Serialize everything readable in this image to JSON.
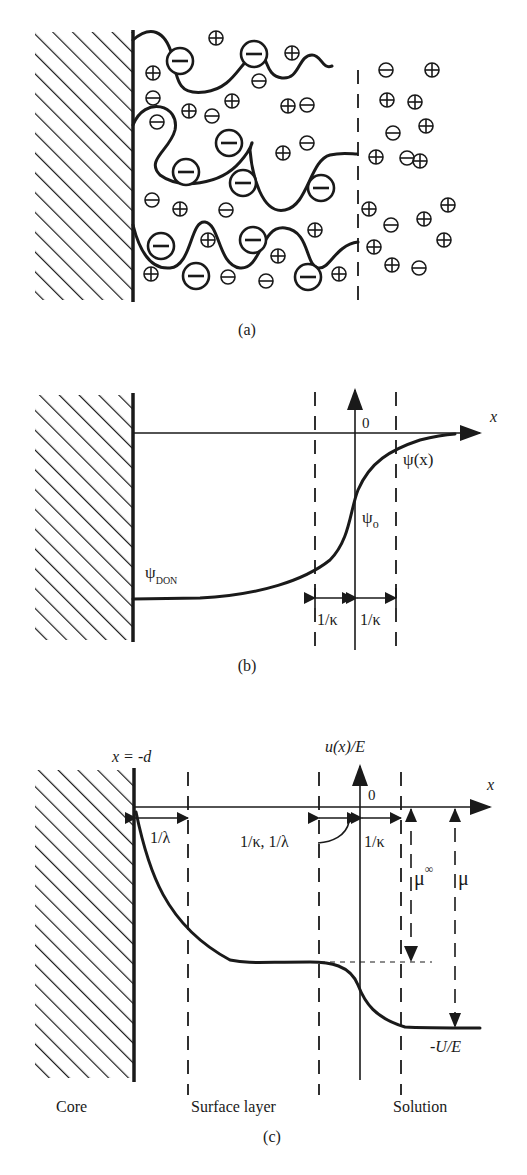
{
  "figure": {
    "header_text": "",
    "panels": [
      {
        "id": "a",
        "caption": "(a)",
        "description": "Charged polymer brush (polyelectrolyte layer) on a solid core with mobile ions",
        "ions": {
          "plus": "⊕",
          "minus": "⊖"
        }
      },
      {
        "id": "b",
        "caption": "(b)",
        "labels": {
          "x_axis": "x",
          "origin": "0",
          "psi_x": "ψ(x)",
          "psi_o": "ψ",
          "psi_o_sub": "o",
          "psi_don": "ψ",
          "psi_don_sub": "DON",
          "debye_left": "1/κ",
          "debye_right": "1/κ"
        }
      },
      {
        "id": "c",
        "caption": "(c)",
        "labels": {
          "wall_position": "x = -d",
          "y_axis": "u(x)/E",
          "x_axis": "x",
          "origin": "0",
          "lambda_left": "1/λ",
          "kappa_lambda": "1/κ, 1/λ",
          "kappa_right": "1/κ",
          "mu_infinity": "μ",
          "mu_infinity_sup": "∞",
          "mu": "μ",
          "minus_u_over_e": "-U/E"
        },
        "regions": [
          "Core",
          "Surface layer",
          "Solution"
        ]
      }
    ]
  }
}
